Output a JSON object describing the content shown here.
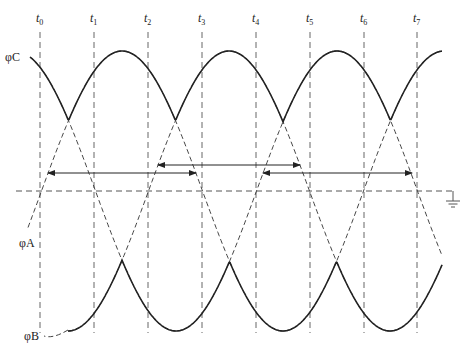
{
  "diagram": {
    "time_markers": [
      {
        "label": "t",
        "sub": "0",
        "x": 40
      },
      {
        "label": "t",
        "sub": "1",
        "x": 94
      },
      {
        "label": "t",
        "sub": "2",
        "x": 148
      },
      {
        "label": "t",
        "sub": "3",
        "x": 202
      },
      {
        "label": "t",
        "sub": "4",
        "x": 256
      },
      {
        "label": "t",
        "sub": "5",
        "x": 310
      },
      {
        "label": "t",
        "sub": "6",
        "x": 364
      },
      {
        "label": "t",
        "sub": "7",
        "x": 417
      }
    ],
    "phases": [
      {
        "name": "φC",
        "peak_x": 15
      },
      {
        "name": "φA",
        "peak_x": 122
      },
      {
        "name": "φB",
        "peak_x": 229
      }
    ],
    "phase_labels": {
      "c": "φC",
      "a": "φA",
      "b": "φB"
    },
    "geometry": {
      "period_px": 322,
      "amplitude_px": 140,
      "baseline_y": 191,
      "x_start": 28,
      "x_end": 442
    },
    "arrows": [
      {
        "x1": 48,
        "x2": 196,
        "y": 173
      },
      {
        "x1": 158,
        "x2": 300,
        "y": 165
      },
      {
        "x1": 263,
        "x2": 412,
        "y": 173
      }
    ],
    "ground_symbol": "ground-icon",
    "colors": {
      "line": "#222222",
      "dash": "#555555"
    }
  }
}
